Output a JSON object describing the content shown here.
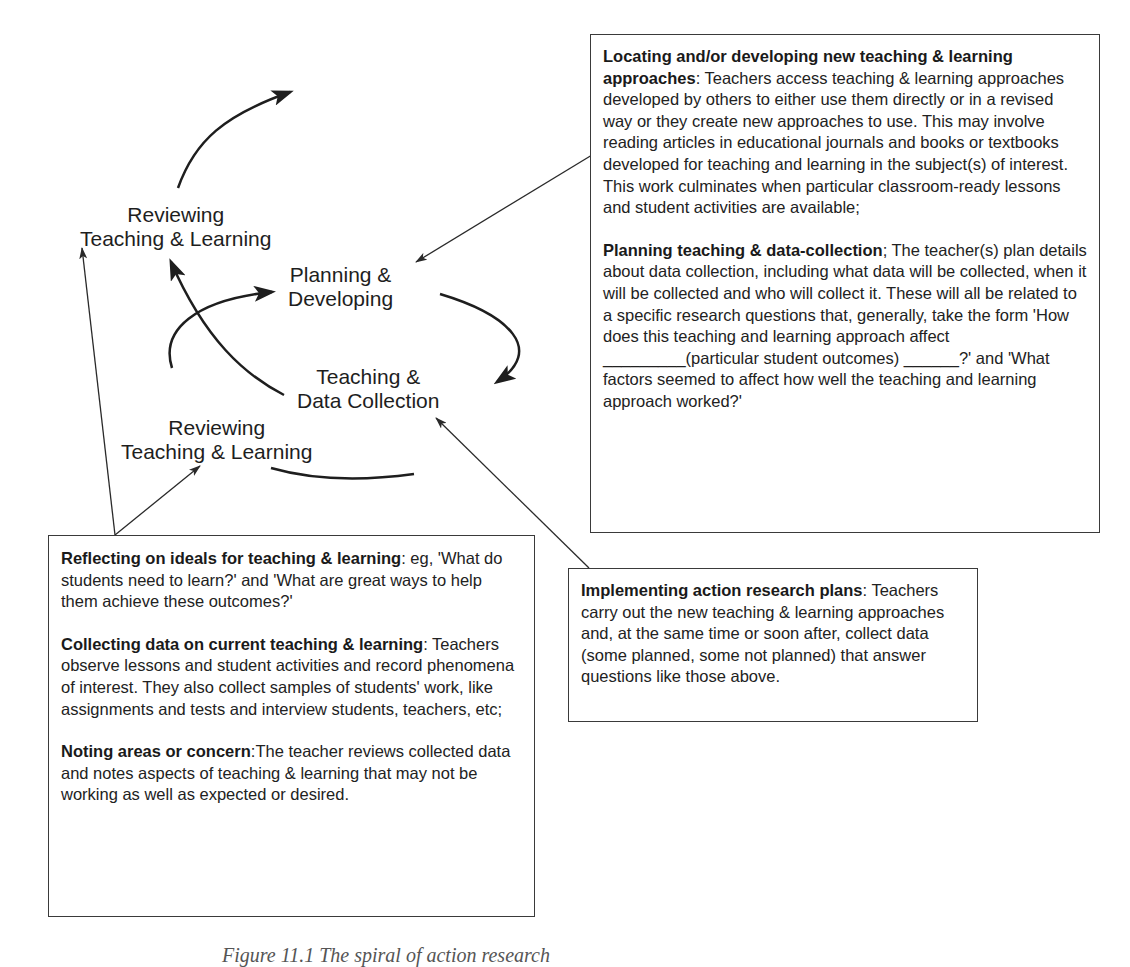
{
  "cycle_labels": {
    "reviewing_top": {
      "line1": "Reviewing",
      "line2": "Teaching & Learning"
    },
    "planning": {
      "line1": "Planning &",
      "line2": "Developing"
    },
    "teaching": {
      "line1": "Teaching &",
      "line2": "Data Collection"
    },
    "reviewing_bottom": {
      "line1": "Reviewing",
      "line2": "Teaching & Learning"
    }
  },
  "boxes": {
    "planning_box": {
      "sections": [
        {
          "heading": "Locating and/or developing new teaching & learning approaches",
          "separator": ": ",
          "body": "Teachers access teaching & learning approaches developed by others to either use them directly or in a revised way or they create new approaches to use. This may involve reading articles in educational journals and books or textbooks developed for teaching and learning in the subject(s) of interest. This work culminates when particular classroom-ready lessons and student activities are available;"
        },
        {
          "heading": "Planning teaching & data-collection",
          "separator": "; ",
          "body": "The teacher(s) plan details about data collection, including what data will be collected, when it will be collected and who will collect it. These will all be related to a specific research questions that, generally, take the form 'How does this teaching and learning approach affect _________(particular student outcomes) ______?' and 'What factors seemed to affect how well the teaching and learning approach worked?'"
        }
      ]
    },
    "implementing_box": {
      "sections": [
        {
          "heading": "Implementing action research plans",
          "separator": ": ",
          "body": "Teachers carry out the new teaching & learning approaches and, at the same time or soon after, collect data (some planned, some not planned) that answer questions like those above."
        }
      ]
    },
    "reviewing_box": {
      "sections": [
        {
          "heading": "Reflecting on ideals for teaching & learning",
          "separator": ": ",
          "body": "eg, 'What do students need to learn?' and 'What are great ways to help them achieve these outcomes?'"
        },
        {
          "heading": "Collecting data on current teaching & learning",
          "separator": ": ",
          "body": "Teachers observe lessons and student activities and record phenomena of interest. They also collect samples of students' work, like assignments and tests and interview students, teachers, etc;"
        },
        {
          "heading": "Noting areas or concern",
          "separator": ":",
          "body": "The teacher reviews collected data and notes aspects of teaching & learning that may not be working as well as expected or desired."
        }
      ]
    }
  },
  "caption": "Figure 11.1   The spiral of action research",
  "colors": {
    "ink": "#1e1e1e",
    "border": "#3a3a3a",
    "background": "#ffffff"
  }
}
